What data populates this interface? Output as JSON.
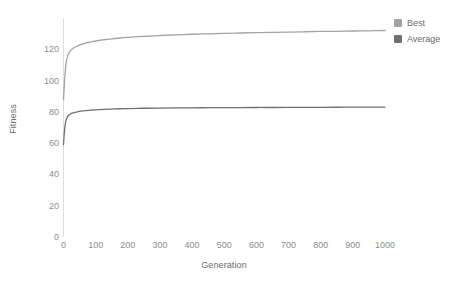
{
  "chart_data": {
    "type": "line",
    "title": "",
    "xlabel": "Generation",
    "ylabel": "Fitness",
    "xlim": [
      0,
      1000
    ],
    "ylim": [
      0,
      140
    ],
    "xticks": [
      0,
      100,
      200,
      300,
      400,
      500,
      600,
      700,
      800,
      900,
      1000
    ],
    "yticks": [
      0,
      20,
      40,
      60,
      80,
      100,
      120
    ],
    "xtick_labels": [
      "0",
      "100",
      "200",
      "300",
      "400",
      "500",
      "600",
      "700",
      "800",
      "900",
      "1000"
    ],
    "ytick_labels": [
      "0",
      "20",
      "40",
      "60",
      "80",
      "100",
      "120"
    ],
    "grid": false,
    "legend_position": "top-right",
    "x": [
      0,
      2,
      5,
      8,
      12,
      16,
      20,
      25,
      30,
      40,
      50,
      60,
      70,
      80,
      90,
      100,
      125,
      150,
      175,
      200,
      250,
      300,
      350,
      400,
      450,
      500,
      550,
      600,
      650,
      700,
      750,
      800,
      850,
      900,
      950,
      1000
    ],
    "series": [
      {
        "name": "Best",
        "color": "#a3a3a3",
        "values": [
          88.0,
          95.0,
          105.0,
          111.0,
          115.0,
          117.2,
          118.6,
          119.8,
          120.6,
          121.8,
          122.7,
          123.4,
          124.0,
          124.5,
          124.9,
          125.3,
          126.1,
          126.7,
          127.2,
          127.6,
          128.3,
          128.8,
          129.2,
          129.6,
          129.9,
          130.2,
          130.4,
          130.6,
          130.8,
          131.0,
          131.2,
          131.4,
          131.5,
          131.7,
          131.8,
          132.0
        ]
      },
      {
        "name": "Average",
        "color": "#707070",
        "values": [
          59.0,
          65.0,
          71.5,
          74.8,
          76.8,
          77.8,
          78.4,
          79.0,
          79.4,
          79.9,
          80.3,
          80.6,
          80.8,
          81.0,
          81.2,
          81.3,
          81.6,
          81.8,
          82.0,
          82.1,
          82.3,
          82.4,
          82.5,
          82.6,
          82.65,
          82.7,
          82.75,
          82.8,
          82.8,
          82.85,
          82.9,
          82.9,
          82.95,
          83.0,
          83.0,
          83.0
        ]
      }
    ]
  },
  "legend": {
    "items": [
      {
        "label": "Best",
        "color": "#a3a3a3"
      },
      {
        "label": "Average",
        "color": "#707070"
      }
    ]
  },
  "axes": {
    "x_title": "Generation",
    "y_title": "Fitness",
    "axis_line_color": "#dcdcdc"
  }
}
